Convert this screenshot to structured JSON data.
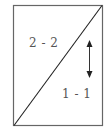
{
  "diagram": {
    "type": "rectangle-split-by-diagonal",
    "colors": {
      "stroke": "#555555",
      "diagonal": "#222222",
      "text": "#555555",
      "background": "#ffffff"
    },
    "regions": [
      {
        "id": "upper-left",
        "label": "2 - 2"
      },
      {
        "id": "lower-right",
        "label": "1 - 1"
      }
    ],
    "arrow": {
      "direction": "vertical",
      "heads": "both",
      "icon": "double-headed-vertical-arrow-icon"
    }
  }
}
